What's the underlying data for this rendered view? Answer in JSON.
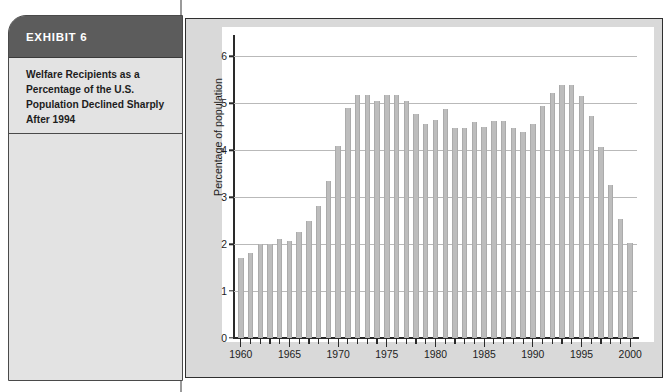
{
  "exhibit": {
    "header_label": "EXHIBIT 6",
    "caption": "Welfare Recipients as a Percentage of the U.S. Population Declined Sharply After 1994"
  },
  "colors": {
    "header_bg": "#5c5c5c",
    "card_bg": "#e3e3e3",
    "panel_bg": "#d9d9d9",
    "plot_bg": "#ffffff",
    "bar_fill": "#bdbdbd",
    "gridline": "#b9b9b9",
    "axis": "#2a2a2a",
    "text": "#1d1d1d"
  },
  "chart_data": {
    "type": "bar",
    "title": "",
    "subtitle": "",
    "xlabel": "",
    "ylabel": "Percentage of population",
    "xlim": [
      1959.3,
      2000.7
    ],
    "ylim": [
      0,
      6.2
    ],
    "grid": true,
    "legend": false,
    "legend_position": "none",
    "y_ticks": [
      0,
      1,
      2,
      3,
      4,
      5,
      6
    ],
    "y_tick_labels": [
      "0",
      "1",
      "2",
      "3",
      "4",
      "5",
      "6"
    ],
    "x_tick_labels": [
      "1960",
      "1965",
      "1970",
      "1975",
      "1980",
      "1985",
      "1990",
      "1995",
      "2000"
    ],
    "x_major_ticks": [
      1960,
      1965,
      1970,
      1975,
      1980,
      1985,
      1990,
      1995,
      2000
    ],
    "categories": [
      "1960",
      "1961",
      "1962",
      "1963",
      "1964",
      "1965",
      "1966",
      "1967",
      "1968",
      "1969",
      "1970",
      "1971",
      "1972",
      "1973",
      "1974",
      "1975",
      "1976",
      "1977",
      "1978",
      "1979",
      "1980",
      "1981",
      "1982",
      "1983",
      "1984",
      "1985",
      "1986",
      "1987",
      "1988",
      "1989",
      "1990",
      "1991",
      "1992",
      "1993",
      "1994",
      "1995",
      "1996",
      "1997",
      "1998",
      "1999",
      "2000"
    ],
    "values": [
      1.7,
      1.81,
      2.0,
      2.0,
      2.1,
      2.06,
      2.25,
      2.5,
      2.82,
      3.35,
      4.1,
      4.9,
      5.18,
      5.18,
      5.06,
      5.18,
      5.18,
      5.06,
      4.77,
      4.55,
      4.65,
      4.89,
      4.47,
      4.47,
      4.6,
      4.49,
      4.62,
      4.62,
      4.47,
      4.39,
      4.57,
      4.94,
      5.21,
      5.39,
      5.4,
      5.16,
      4.73,
      4.07,
      3.25,
      2.54,
      2.02
    ]
  }
}
